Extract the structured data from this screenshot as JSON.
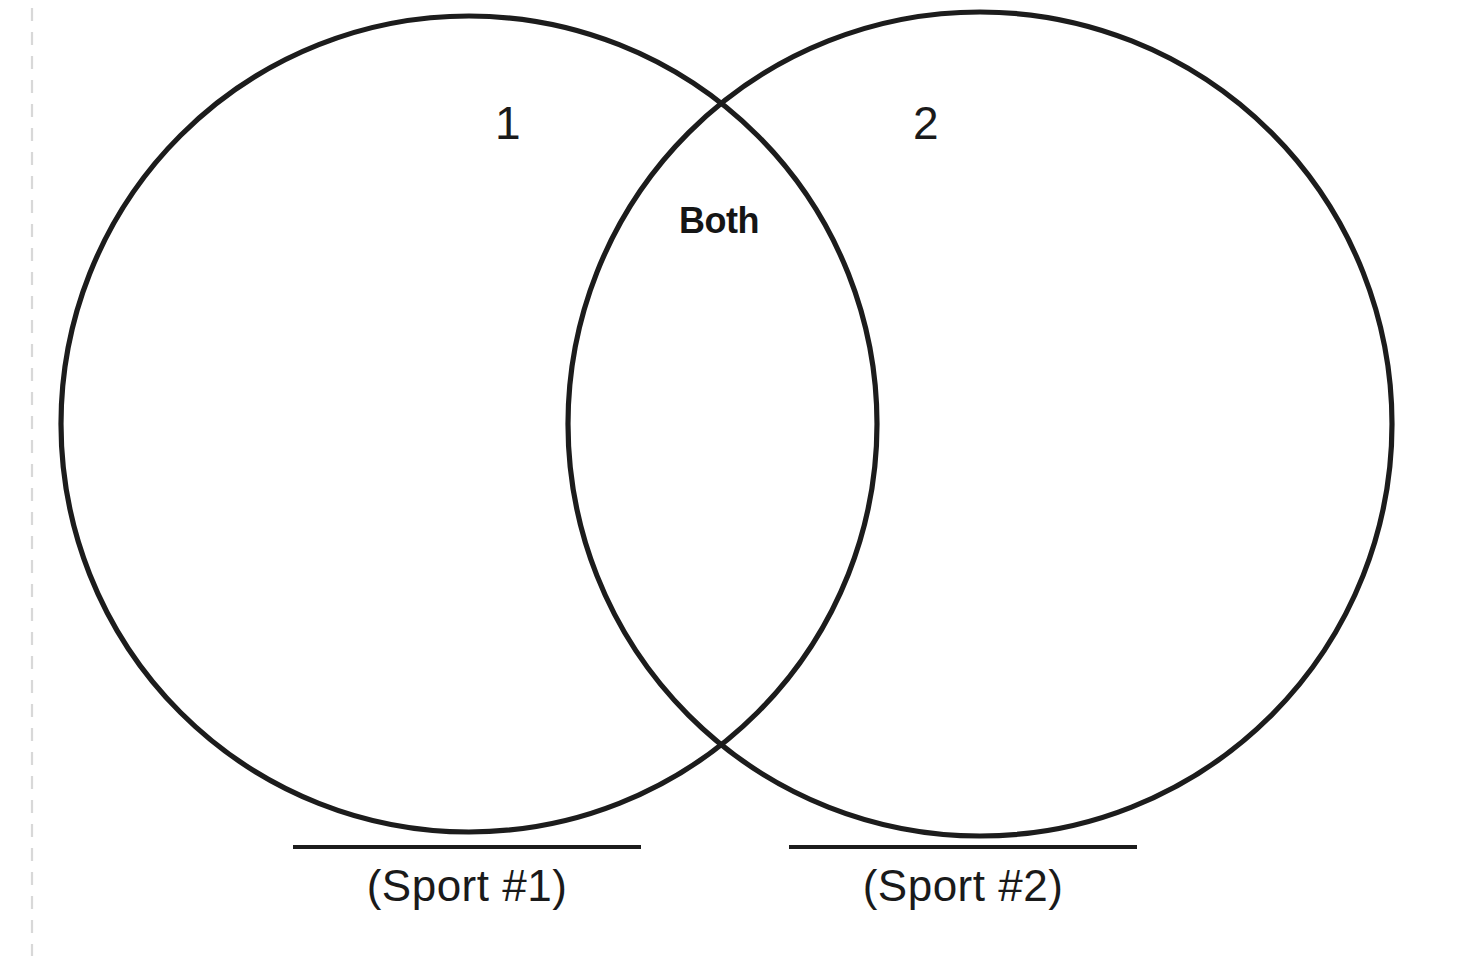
{
  "page": {
    "background_color": "#ffffff",
    "stroke_color": "#1c1c1c",
    "text_color": "#1a1a1a",
    "guide_color": "#d8d8d8",
    "width": 1467,
    "height": 962
  },
  "diagram": {
    "type": "venn-2-set",
    "left_circle": {
      "label": "1",
      "center_x": 469,
      "center_y": 424,
      "radius": 408
    },
    "right_circle": {
      "label": "2",
      "center_x": 980,
      "center_y": 424,
      "radius": 412
    },
    "intersection": {
      "label": "Both"
    }
  },
  "captions": [
    {
      "id": "caption-1",
      "text": "(Sport #1)",
      "rule": true
    },
    {
      "id": "caption-2",
      "text": "(Sport #2)",
      "rule": true
    }
  ],
  "guides": {
    "left_dashed_line": {
      "name": "fold-guide",
      "x": 32,
      "style": "dashed"
    }
  }
}
